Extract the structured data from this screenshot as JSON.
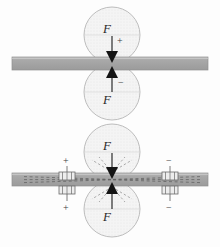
{
  "figure": {
    "background_color": "#fdfdfd",
    "width": 220,
    "height": 247,
    "panels": [
      {
        "id": "top-panel",
        "name": "rollers-without-electrodes",
        "bar": {
          "name": "horizontal-bar",
          "fill": "#a6a6a6",
          "edge": "#8c8c8c",
          "x": 12,
          "y": 57,
          "w": 196,
          "h": 13,
          "has_dashed_field_lines": false
        },
        "rollers": [
          {
            "name": "upper-roller",
            "cx": 112,
            "cy": 35,
            "r": 28,
            "fill": "#f2f2f2",
            "stroke": "#b5b5b5",
            "force_label": "F",
            "polarity_sign": "+",
            "arrow_direction": "down"
          },
          {
            "name": "lower-roller",
            "cx": 112,
            "cy": 92,
            "r": 28,
            "fill": "#f2f2f2",
            "stroke": "#b5b5b5",
            "force_label": "F",
            "polarity_sign": "−",
            "arrow_direction": "up"
          }
        ]
      },
      {
        "id": "bottom-panel",
        "name": "rollers-with-electrodes",
        "bar": {
          "name": "horizontal-bar",
          "fill": "#a6a6a6",
          "edge": "#8c8c8c",
          "x": 12,
          "y": 173,
          "w": 196,
          "h": 13,
          "has_dashed_field_lines": true
        },
        "rollers": [
          {
            "name": "upper-roller",
            "cx": 112,
            "cy": 152,
            "r": 28,
            "fill": "#f2f2f2",
            "stroke": "#b5b5b5",
            "force_label": "F",
            "polarity_sign": "",
            "arrow_direction": "down"
          },
          {
            "name": "lower-roller",
            "cx": 112,
            "cy": 209,
            "r": 28,
            "fill": "#f2f2f2",
            "stroke": "#b5b5b5",
            "force_label": "F",
            "polarity_sign": "",
            "arrow_direction": "up"
          }
        ],
        "electrodes": [
          {
            "name": "left-electrode",
            "x": 67,
            "y": 179,
            "top_sign": "+",
            "bottom_sign": "+"
          },
          {
            "name": "right-electrode",
            "x": 170,
            "y": 179,
            "top_sign": "−",
            "bottom_sign": "−"
          }
        ]
      }
    ],
    "colors": {
      "bar_fill": "#a6a6a6",
      "roller_fill": "#f2f2f2",
      "roller_stroke": "#b5b5b5",
      "arrow": "#1a1a1a",
      "text": "#2b2b2b",
      "dashed_line": "#6e6e6e"
    }
  }
}
